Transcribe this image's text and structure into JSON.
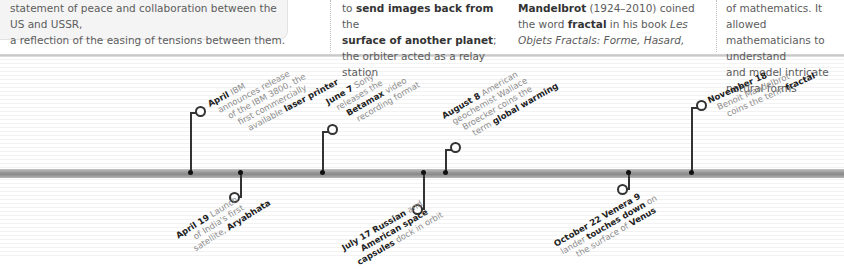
{
  "cards": [
    {
      "line1": "statement of peace and collaboration between the US and USSR,",
      "line2": "a reflection of the easing of tensions between them."
    },
    {
      "line1_pre": "to ",
      "line1_bold": "send images back from",
      "line1_post": " the",
      "line2_bold": "surface of another planet",
      "line2_post": ";",
      "line3": "the orbiter acted as a relay station"
    },
    {
      "line1_bold": "Mandelbrot",
      "line1_post": " (1924–2010) coined",
      "line2_pre": "the word ",
      "line2_bold": "fractal",
      "line2_post": " in his book ",
      "line2_italic": "Les",
      "line3_italic": "Objets Fractals: Forme, Hasard,"
    },
    {
      "line1": "of mathematics. It allowed",
      "line2": "mathematicians to understand",
      "line3": "and model intricate natural forms"
    }
  ],
  "events_above": [
    {
      "date": "April",
      "lines": [
        "IBM",
        "announces release",
        "of the IBM 3800, the",
        "first commercially",
        "available "
      ],
      "bold_tail": "laser printer"
    },
    {
      "date": "June 7",
      "lines": [
        "Sony",
        "releases the",
        "",
        "recording format"
      ],
      "bold_mid": "Betamax",
      "mid_tail": " video"
    },
    {
      "date": "August 8",
      "lines": [
        "American",
        "geochemist Wallace",
        "Broecker coins the",
        "term "
      ],
      "bold_tail": "global warming"
    },
    {
      "date": "November 18",
      "lines": [
        "Benoit Mandelbrot",
        "coins the term "
      ],
      "bold_tail": "fractal"
    }
  ],
  "events_below": [
    {
      "date": "April 19",
      "lines": [
        "Launch",
        "of India's first",
        "satellite, "
      ],
      "bold_tail": "Aryabhata"
    },
    {
      "date": "July 17",
      "bold1": "Russian",
      "t1": " and",
      "bold2": "American space",
      "bold3": "capsules",
      "t3": " dock in orbit"
    },
    {
      "date": "October 22",
      "bold1": "Venera 9",
      "t2pre": "lander ",
      "bold2": "touches down",
      "t2post": " on",
      "t3pre": "the surface of ",
      "bold3": "Venus"
    }
  ]
}
